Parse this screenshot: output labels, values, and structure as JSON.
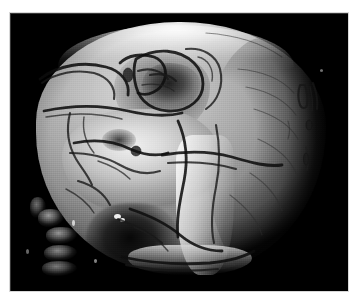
{
  "viewer": {
    "width": 356,
    "height": 303,
    "background_color": "#ffffff",
    "caption": ""
  },
  "render": {
    "modality": "CT",
    "technique": "3D volume rendering",
    "subject": "human skull",
    "view": "left lateral oblique",
    "background_color": "#000000",
    "frame": {
      "x": 10,
      "y": 13,
      "width": 338,
      "height": 278
    },
    "border_color": "#d8d8d8",
    "colormap": "grayscale",
    "intensity_range": {
      "min": 0,
      "max": 255
    },
    "bone_tone_light": "#e8e8e8",
    "bone_tone_mid": "#9a9a9a",
    "bone_tone_dark": "#3c3c3c",
    "suture_color": "#181818"
  },
  "anatomy": {
    "structures": [
      {
        "name": "cranial-vault",
        "label": "Cranial vault",
        "tone": "bright"
      },
      {
        "name": "frontal-bone",
        "label": "Frontal bone",
        "tone": "bright"
      },
      {
        "name": "parietal-bone",
        "label": "Parietal bone",
        "tone": "mid"
      },
      {
        "name": "occipital-region",
        "label": "Occipital region",
        "tone": "dark"
      },
      {
        "name": "temporal-fossa",
        "label": "Temporal fossa",
        "tone": "mid"
      },
      {
        "name": "orbit",
        "label": "Orbit",
        "tone": "dark"
      },
      {
        "name": "nasal-aperture",
        "label": "Nasal aperture",
        "tone": "dark"
      },
      {
        "name": "zygomatic-arch",
        "label": "Zygomatic arch",
        "tone": "bright"
      },
      {
        "name": "maxilla",
        "label": "Maxilla",
        "tone": "bright"
      },
      {
        "name": "mandibular-ramus",
        "label": "Mandibular ramus",
        "tone": "bright"
      },
      {
        "name": "mandible-body",
        "label": "Mandible body",
        "tone": "mid"
      },
      {
        "name": "cervical-vertebrae",
        "label": "Cervical vertebrae",
        "tone": "mid"
      }
    ],
    "feature_counts": {
      "suture_lines": 34,
      "foramina": 6,
      "vertebral_fragments": 5,
      "bright_specks": 6
    }
  },
  "overlay": {
    "annotations_visible": false,
    "scale_bar_visible": false,
    "orientation_markers_visible": false,
    "text_labels": []
  }
}
